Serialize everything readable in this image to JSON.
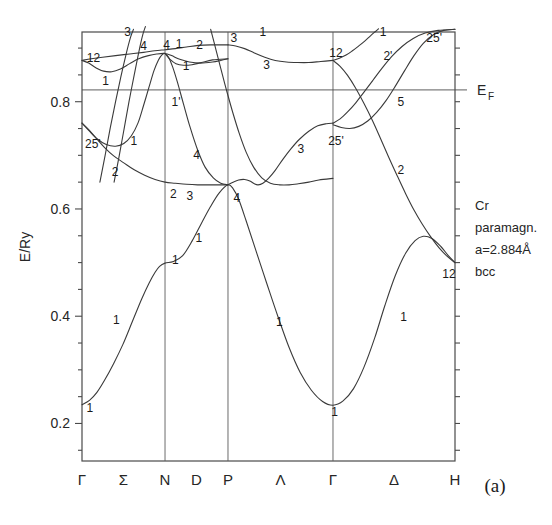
{
  "panel": {
    "label": "(a)"
  },
  "axes": {
    "ylabel": "E/Ry",
    "y_ticks": [
      "0.2",
      "0.4",
      "0.6",
      "0.8"
    ],
    "y_tick_values": [
      0.2,
      0.4,
      0.6,
      0.8
    ],
    "y_minor_values": [
      0.15,
      0.25,
      0.3,
      0.35,
      0.45,
      0.5,
      0.55,
      0.65,
      0.7,
      0.75,
      0.85,
      0.9
    ],
    "ylim": [
      0.13,
      0.93
    ],
    "x_symbols": [
      "Γ",
      "Σ",
      "N",
      "D",
      "P",
      "Λ",
      "Γ",
      "Δ",
      "H"
    ],
    "x_symbol_kind": [
      "point",
      "line",
      "point",
      "line",
      "point",
      "line",
      "point",
      "line",
      "point"
    ]
  },
  "fermi": {
    "label": "E",
    "sublabel": "F",
    "value": 0.822
  },
  "annotation": {
    "lines": [
      "Cr",
      "paramagn.",
      "a=2.884Å",
      "bcc"
    ]
  },
  "chart_data": {
    "type": "line",
    "title": "",
    "xlabel": "",
    "ylabel": "E/Ry",
    "ylim": [
      0.13,
      0.93
    ],
    "grid": false,
    "legend": "none",
    "material": "Cr paramagnetic bcc, a=2.884 Å",
    "fermi_level": 0.822,
    "high_symmetry_points": [
      {
        "symbol": "Γ",
        "x": 0.0
      },
      {
        "symbol": "N",
        "x": 0.2226
      },
      {
        "symbol": "P",
        "x": 0.3914
      },
      {
        "symbol": "Γ",
        "x": 0.6729
      },
      {
        "symbol": "H",
        "x": 1.0
      }
    ],
    "segment_labels": [
      "Σ",
      "D",
      "Λ",
      "Δ"
    ],
    "bands": [
      {
        "name": "band-1-lowest",
        "points": [
          [
            0.0,
            0.235
          ],
          [
            0.02,
            0.243
          ],
          [
            0.04,
            0.258
          ],
          [
            0.06,
            0.28
          ],
          [
            0.085,
            0.312
          ],
          [
            0.11,
            0.348
          ],
          [
            0.135,
            0.39
          ],
          [
            0.16,
            0.432
          ],
          [
            0.18,
            0.462
          ],
          [
            0.196,
            0.482
          ],
          [
            0.208,
            0.493
          ],
          [
            0.2226,
            0.499
          ],
          [
            0.245,
            0.502
          ],
          [
            0.27,
            0.513
          ],
          [
            0.295,
            0.54
          ],
          [
            0.32,
            0.573
          ],
          [
            0.345,
            0.605
          ],
          [
            0.368,
            0.63
          ],
          [
            0.3914,
            0.645
          ],
          [
            0.405,
            0.638
          ],
          [
            0.42,
            0.618
          ],
          [
            0.44,
            0.578
          ],
          [
            0.465,
            0.525
          ],
          [
            0.495,
            0.462
          ],
          [
            0.525,
            0.4
          ],
          [
            0.555,
            0.342
          ],
          [
            0.585,
            0.295
          ],
          [
            0.615,
            0.262
          ],
          [
            0.645,
            0.241
          ],
          [
            0.6729,
            0.234
          ],
          [
            0.7,
            0.242
          ],
          [
            0.728,
            0.265
          ],
          [
            0.756,
            0.305
          ],
          [
            0.785,
            0.36
          ],
          [
            0.812,
            0.42
          ],
          [
            0.84,
            0.476
          ],
          [
            0.868,
            0.518
          ],
          [
            0.893,
            0.541
          ],
          [
            0.915,
            0.549
          ],
          [
            0.938,
            0.545
          ],
          [
            0.962,
            0.53
          ],
          [
            0.982,
            0.513
          ],
          [
            1.0,
            0.5
          ]
        ]
      },
      {
        "name": "band-2-sigma2",
        "points": [
          [
            0.0,
            0.76
          ],
          [
            0.018,
            0.748
          ],
          [
            0.038,
            0.732
          ],
          [
            0.06,
            0.715
          ],
          [
            0.085,
            0.699
          ],
          [
            0.112,
            0.686
          ],
          [
            0.14,
            0.673
          ],
          [
            0.168,
            0.663
          ],
          [
            0.196,
            0.655
          ],
          [
            0.2226,
            0.65
          ],
          [
            0.25,
            0.648
          ],
          [
            0.28,
            0.646
          ],
          [
            0.31,
            0.645
          ],
          [
            0.34,
            0.645
          ],
          [
            0.365,
            0.645
          ],
          [
            0.3914,
            0.645
          ]
        ]
      },
      {
        "name": "band-3-sigma1-rise",
        "points": [
          [
            0.0,
            0.76
          ],
          [
            0.02,
            0.745
          ],
          [
            0.042,
            0.73
          ],
          [
            0.065,
            0.72
          ],
          [
            0.09,
            0.717
          ],
          [
            0.112,
            0.722
          ],
          [
            0.132,
            0.736
          ],
          [
            0.15,
            0.76
          ],
          [
            0.165,
            0.793
          ],
          [
            0.18,
            0.828
          ],
          [
            0.193,
            0.858
          ],
          [
            0.205,
            0.878
          ],
          [
            0.215,
            0.888
          ],
          [
            0.2226,
            0.89
          ],
          [
            0.232,
            0.883
          ],
          [
            0.243,
            0.865
          ],
          [
            0.256,
            0.836
          ],
          [
            0.272,
            0.796
          ],
          [
            0.29,
            0.752
          ],
          [
            0.31,
            0.71
          ],
          [
            0.33,
            0.678
          ],
          [
            0.352,
            0.658
          ],
          [
            0.372,
            0.648
          ],
          [
            0.3914,
            0.645
          ]
        ]
      },
      {
        "name": "band-4-gamma12-lower",
        "points": [
          [
            0.0,
            0.877
          ],
          [
            0.018,
            0.872
          ],
          [
            0.038,
            0.863
          ],
          [
            0.058,
            0.857
          ],
          [
            0.08,
            0.856
          ],
          [
            0.103,
            0.861
          ],
          [
            0.128,
            0.871
          ],
          [
            0.152,
            0.88
          ],
          [
            0.178,
            0.886
          ],
          [
            0.2,
            0.889
          ],
          [
            0.2226,
            0.89
          ],
          [
            0.24,
            0.886
          ],
          [
            0.262,
            0.879
          ],
          [
            0.288,
            0.874
          ],
          [
            0.318,
            0.872
          ],
          [
            0.35,
            0.874
          ],
          [
            0.372,
            0.877
          ],
          [
            0.3914,
            0.88
          ]
        ]
      },
      {
        "name": "band-5-gamma12-upper",
        "points": [
          [
            0.0,
            0.877
          ],
          [
            0.025,
            0.88
          ],
          [
            0.055,
            0.883
          ],
          [
            0.09,
            0.886
          ],
          [
            0.128,
            0.889
          ],
          [
            0.165,
            0.892
          ],
          [
            0.195,
            0.895
          ],
          [
            0.2226,
            0.897
          ],
          [
            0.25,
            0.899
          ],
          [
            0.28,
            0.902
          ],
          [
            0.312,
            0.905
          ],
          [
            0.345,
            0.906
          ],
          [
            0.3914,
            0.906
          ]
        ]
      },
      {
        "name": "band-6-sigma3-steep",
        "points": [
          [
            0.048,
            0.65
          ],
          [
            0.062,
            0.7
          ],
          [
            0.076,
            0.752
          ],
          [
            0.09,
            0.8
          ],
          [
            0.104,
            0.846
          ],
          [
            0.118,
            0.888
          ],
          [
            0.13,
            0.92
          ],
          [
            0.138,
            0.935
          ]
        ]
      },
      {
        "name": "band-7-sigma4-steep",
        "points": [
          [
            0.086,
            0.65
          ],
          [
            0.1,
            0.7
          ],
          [
            0.113,
            0.75
          ],
          [
            0.126,
            0.8
          ],
          [
            0.14,
            0.85
          ],
          [
            0.153,
            0.895
          ],
          [
            0.163,
            0.925
          ],
          [
            0.17,
            0.94
          ]
        ]
      },
      {
        "name": "band-8-lambda3-upper",
        "points": [
          [
            0.3914,
            0.906
          ],
          [
            0.412,
            0.904
          ],
          [
            0.436,
            0.899
          ],
          [
            0.462,
            0.891
          ],
          [
            0.49,
            0.883
          ],
          [
            0.518,
            0.877
          ],
          [
            0.548,
            0.874
          ],
          [
            0.578,
            0.873
          ],
          [
            0.608,
            0.873
          ],
          [
            0.64,
            0.875
          ],
          [
            0.6729,
            0.877
          ]
        ]
      },
      {
        "name": "band-9-lambda3-lower",
        "points": [
          [
            0.3914,
            0.645
          ],
          [
            0.405,
            0.65
          ],
          [
            0.42,
            0.654
          ],
          [
            0.436,
            0.655
          ],
          [
            0.45,
            0.652
          ],
          [
            0.462,
            0.647
          ],
          [
            0.472,
            0.645
          ],
          [
            0.485,
            0.648
          ],
          [
            0.5,
            0.657
          ],
          [
            0.518,
            0.672
          ],
          [
            0.538,
            0.692
          ],
          [
            0.56,
            0.712
          ],
          [
            0.583,
            0.73
          ],
          [
            0.608,
            0.745
          ],
          [
            0.632,
            0.755
          ],
          [
            0.655,
            0.759
          ],
          [
            0.6729,
            0.76
          ]
        ]
      },
      {
        "name": "band-10-lambda1-descend",
        "points": [
          [
            0.345,
            0.935
          ],
          [
            0.358,
            0.9
          ],
          [
            0.372,
            0.862
          ],
          [
            0.388,
            0.82
          ],
          [
            0.405,
            0.778
          ],
          [
            0.422,
            0.74
          ],
          [
            0.44,
            0.706
          ],
          [
            0.46,
            0.678
          ],
          [
            0.482,
            0.658
          ],
          [
            0.505,
            0.648
          ],
          [
            0.53,
            0.645
          ],
          [
            0.555,
            0.645
          ],
          [
            0.58,
            0.647
          ],
          [
            0.608,
            0.65
          ],
          [
            0.635,
            0.654
          ],
          [
            0.6729,
            0.657
          ]
        ]
      },
      {
        "name": "band-11-delta1-up",
        "points": [
          [
            0.6729,
            0.877
          ],
          [
            0.69,
            0.881
          ],
          [
            0.708,
            0.887
          ],
          [
            0.725,
            0.895
          ],
          [
            0.742,
            0.904
          ],
          [
            0.758,
            0.913
          ],
          [
            0.772,
            0.922
          ],
          [
            0.785,
            0.93
          ],
          [
            0.795,
            0.936
          ]
        ]
      },
      {
        "name": "band-12-delta2prime",
        "points": [
          [
            0.6729,
            0.76
          ],
          [
            0.692,
            0.768
          ],
          [
            0.712,
            0.781
          ],
          [
            0.734,
            0.798
          ],
          [
            0.756,
            0.818
          ],
          [
            0.78,
            0.84
          ],
          [
            0.805,
            0.863
          ],
          [
            0.83,
            0.884
          ],
          [
            0.858,
            0.903
          ],
          [
            0.888,
            0.918
          ],
          [
            0.92,
            0.928
          ],
          [
            0.955,
            0.933
          ],
          [
            1.0,
            0.935
          ]
        ]
      },
      {
        "name": "band-13-delta5",
        "points": [
          [
            0.6729,
            0.757
          ],
          [
            0.695,
            0.752
          ],
          [
            0.718,
            0.75
          ],
          [
            0.742,
            0.754
          ],
          [
            0.766,
            0.764
          ],
          [
            0.79,
            0.78
          ],
          [
            0.815,
            0.802
          ],
          [
            0.84,
            0.829
          ],
          [
            0.865,
            0.858
          ],
          [
            0.89,
            0.886
          ],
          [
            0.915,
            0.909
          ],
          [
            0.942,
            0.925
          ],
          [
            0.97,
            0.933
          ],
          [
            1.0,
            0.935
          ]
        ]
      },
      {
        "name": "band-14-delta2-down",
        "points": [
          [
            0.6729,
            0.877
          ],
          [
            0.692,
            0.866
          ],
          [
            0.712,
            0.849
          ],
          [
            0.733,
            0.826
          ],
          [
            0.755,
            0.798
          ],
          [
            0.778,
            0.766
          ],
          [
            0.8,
            0.732
          ],
          [
            0.822,
            0.697
          ],
          [
            0.845,
            0.662
          ],
          [
            0.868,
            0.628
          ],
          [
            0.89,
            0.598
          ],
          [
            0.912,
            0.572
          ],
          [
            0.935,
            0.548
          ],
          [
            0.958,
            0.527
          ],
          [
            0.98,
            0.511
          ],
          [
            1.0,
            0.5
          ]
        ]
      },
      {
        "name": "band-15-d-branch-cross",
        "points": [
          [
            0.2226,
            0.89
          ],
          [
            0.236,
            0.879
          ],
          [
            0.252,
            0.871
          ],
          [
            0.272,
            0.868
          ],
          [
            0.295,
            0.869
          ],
          [
            0.32,
            0.873
          ],
          [
            0.35,
            0.878
          ],
          [
            0.3914,
            0.88
          ]
        ]
      }
    ],
    "band_labels": [
      {
        "text": "1",
        "x": 0.004,
        "y": 0.228
      },
      {
        "text": "1",
        "x": 0.075,
        "y": 0.393
      },
      {
        "text": "1",
        "x": 0.233,
        "y": 0.505
      },
      {
        "text": "1",
        "x": 0.296,
        "y": 0.545
      },
      {
        "text": "2",
        "x": 0.228,
        "y": 0.628
      },
      {
        "text": "3",
        "x": 0.272,
        "y": 0.625
      },
      {
        "text": "4",
        "x": 0.398,
        "y": 0.62
      },
      {
        "text": "25'",
        "x": 0.0,
        "y": 0.722
      },
      {
        "text": "2",
        "x": 0.072,
        "y": 0.668
      },
      {
        "text": "1",
        "x": 0.122,
        "y": 0.726
      },
      {
        "text": "12",
        "x": 0.005,
        "y": 0.882
      },
      {
        "text": "1",
        "x": 0.046,
        "y": 0.838
      },
      {
        "text": "3",
        "x": 0.105,
        "y": 0.93
      },
      {
        "text": "4",
        "x": 0.148,
        "y": 0.903
      },
      {
        "text": "4",
        "x": 0.21,
        "y": 0.905
      },
      {
        "text": "1",
        "x": 0.243,
        "y": 0.908
      },
      {
        "text": "2",
        "x": 0.298,
        "y": 0.905
      },
      {
        "text": "3",
        "x": 0.39,
        "y": 0.918
      },
      {
        "text": "1",
        "x": 0.262,
        "y": 0.866
      },
      {
        "text": "1'",
        "x": 0.232,
        "y": 0.8
      },
      {
        "text": "4",
        "x": 0.29,
        "y": 0.7
      },
      {
        "text": "1",
        "x": 0.468,
        "y": 0.93
      },
      {
        "text": "3",
        "x": 0.478,
        "y": 0.868
      },
      {
        "text": "3",
        "x": 0.57,
        "y": 0.712
      },
      {
        "text": "1",
        "x": 0.512,
        "y": 0.39
      },
      {
        "text": "1",
        "x": 0.66,
        "y": 0.222
      },
      {
        "text": "12",
        "x": 0.655,
        "y": 0.89
      },
      {
        "text": "25'",
        "x": 0.652,
        "y": 0.726
      },
      {
        "text": "1",
        "x": 0.79,
        "y": 0.93
      },
      {
        "text": "2'",
        "x": 0.8,
        "y": 0.885
      },
      {
        "text": "25'",
        "x": 0.915,
        "y": 0.918
      },
      {
        "text": "5",
        "x": 0.838,
        "y": 0.8
      },
      {
        "text": "2",
        "x": 0.838,
        "y": 0.672
      },
      {
        "text": "1",
        "x": 0.845,
        "y": 0.398
      },
      {
        "text": "12",
        "x": 0.958,
        "y": 0.478
      }
    ]
  }
}
